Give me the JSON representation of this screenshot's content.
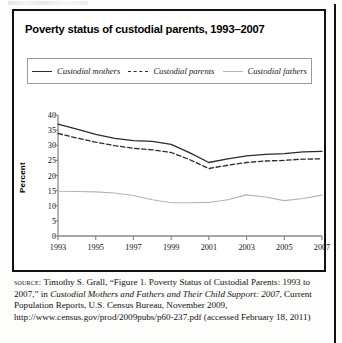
{
  "figure": {
    "title": "Poverty status of custodial parents, 1993–2007",
    "ylabel": "Percent"
  },
  "legend": {
    "items": [
      {
        "label": "Custodial mothers",
        "style": "solid-dark",
        "color": "#2b2b2b"
      },
      {
        "label": "Custodial parents",
        "style": "dashed",
        "color": "#2b2b2b"
      },
      {
        "label": "Custodial fathers",
        "style": "solid-light",
        "color": "#b4b4b4"
      }
    ]
  },
  "chart_data": {
    "type": "line",
    "title": "Poverty status of custodial parents, 1993–2007",
    "xlabel": "",
    "ylabel": "Percent",
    "x": [
      1993,
      1994,
      1995,
      1996,
      1997,
      1998,
      1999,
      2000,
      2001,
      2002,
      2003,
      2004,
      2005,
      2006,
      2007
    ],
    "xticks": [
      "1993",
      "1995",
      "1997",
      "1999",
      "2001",
      "2003",
      "2005",
      "2007"
    ],
    "yticks": [
      "0",
      "5",
      "10",
      "15",
      "20",
      "25",
      "30",
      "35",
      "40"
    ],
    "xlim": [
      1993,
      2007
    ],
    "ylim": [
      0,
      40
    ],
    "grid": false,
    "legend_position": "top",
    "series": [
      {
        "name": "Custodial mothers",
        "color": "#2b2b2b",
        "dash": "none",
        "values": [
          37.0,
          35.3,
          33.6,
          32.3,
          31.5,
          31.3,
          30.3,
          27.5,
          24.3,
          25.5,
          26.5,
          27.0,
          27.2,
          27.8,
          28.0
        ]
      },
      {
        "name": "Custodial parents",
        "color": "#2b2b2b",
        "dash": "dashed",
        "values": [
          33.9,
          32.4,
          31.0,
          29.9,
          29.0,
          28.5,
          27.6,
          25.2,
          22.3,
          23.4,
          24.3,
          24.8,
          25.0,
          25.4,
          25.5
        ]
      },
      {
        "name": "Custodial fathers",
        "color": "#b4b4b4",
        "dash": "none",
        "values": [
          14.8,
          14.7,
          14.6,
          14.2,
          13.4,
          12.0,
          11.0,
          11.0,
          11.1,
          12.0,
          13.6,
          12.9,
          11.7,
          12.4,
          13.5
        ]
      }
    ]
  },
  "source": {
    "label": "source:",
    "text_1": " Timothy S. Grall, “Figure 1. Poverty Status of Custodial Parents: 1993 to 2007,” in ",
    "italic_1": "Custodial Mothers and Fathers and Their Child Support: 2007",
    "text_2": ", Current Population Reports, U.S. Census Bureau, November 2009, http://www.census.gov/prod/2009pubs/p60-237.pdf (accessed February 18, 2011)"
  }
}
